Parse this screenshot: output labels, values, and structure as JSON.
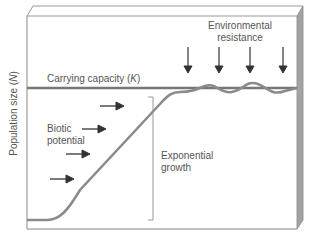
{
  "diagram": {
    "y_axis_label": "Population size (N)",
    "y_axis_label_text": "Population size (",
    "y_axis_label_var": "N",
    "y_axis_label_close": ")",
    "carrying_capacity": {
      "text": "Carrying capacity (",
      "var": "K",
      "close": ")"
    },
    "environmental_resistance": {
      "line1": "Environmental",
      "line2": "resistance",
      "arrow_count": 4
    },
    "biotic_potential": {
      "line1": "Biotic",
      "line2": "potential",
      "arrow_count": 4
    },
    "exponential_growth": {
      "line1": "Exponential",
      "line2": "growth"
    },
    "colors": {
      "curve": "#8a8a8a",
      "carrying_line": "#777777",
      "frame": "#888888",
      "side_panel": "#9a9a9a",
      "text": "#555555",
      "arrow": "#333333"
    }
  }
}
